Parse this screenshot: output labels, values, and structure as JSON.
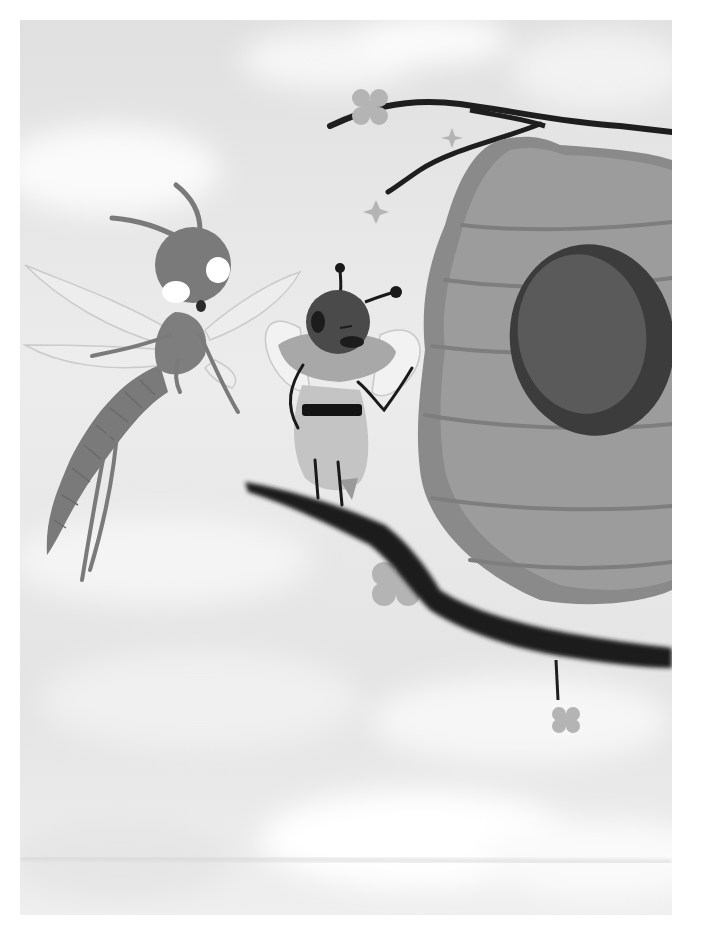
{
  "illustration": {
    "description": "Grayscale storybook illustration: a mosquito flies beside a bee standing on a branch near a large beehive, cloudy sky background",
    "characters": [
      {
        "name": "mosquito",
        "pose": "flying, worried expression, arm outstretched"
      },
      {
        "name": "bee",
        "pose": "standing on branch, hand on hip, ruffled collar"
      }
    ],
    "objects": [
      "beehive",
      "upper-branch",
      "lower-branch",
      "flowers",
      "sparkles",
      "clouds"
    ]
  },
  "colors": {
    "page_bg": "#ffffff",
    "sky_light": "#f4f4f4",
    "sky_mid": "#dcdcdc",
    "branch": "#1e1e1e",
    "hive_light": "#9a9a9a",
    "hive_dark": "#7e7e7e",
    "hive_hole_rim": "#3c3c3c",
    "hive_hole_inner": "#585858",
    "flower": "#b4b4b4",
    "mosquito_body": "#7a7a7a",
    "mosquito_wing": "#ececec",
    "bee_head": "#4a4a4a",
    "bee_body": "#c4c4c4",
    "bee_collar": "#a8a8a8",
    "bee_stripe": "#141414"
  }
}
